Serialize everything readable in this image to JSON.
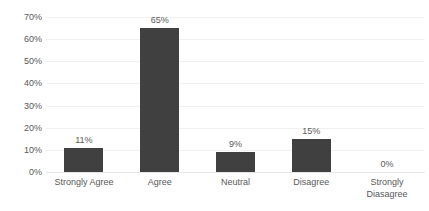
{
  "chart_data": {
    "type": "bar",
    "title": "",
    "subtitle": "",
    "xlabel": "",
    "ylabel": "",
    "categories": [
      "Strongly Agree",
      "Agree",
      "Neutral",
      "Disagree",
      "Strongly Diasagree"
    ],
    "values": [
      11,
      65,
      9,
      15,
      0
    ],
    "data_labels": [
      "11%",
      "65%",
      "9%",
      "15%",
      "0%"
    ],
    "ylim": [
      0,
      70
    ],
    "ytick_step": 10,
    "ytick_labels": [
      "0%",
      "10%",
      "20%",
      "30%",
      "40%",
      "50%",
      "60%",
      "70%"
    ],
    "ytick_values": [
      0,
      10,
      20,
      30,
      40,
      50,
      60,
      70
    ],
    "grid": true,
    "grid_orientation": "horizontal",
    "legend": false,
    "legend_position": "none",
    "series": [
      {
        "name": "Response share",
        "values": [
          11,
          65,
          9,
          15,
          0
        ],
        "color": "#404040"
      }
    ],
    "colors": {
      "bar": "#404040",
      "text": "#595959",
      "gridline": "#f2f2f2",
      "axis": "#e6e6e6",
      "background": "#ffffff"
    }
  }
}
